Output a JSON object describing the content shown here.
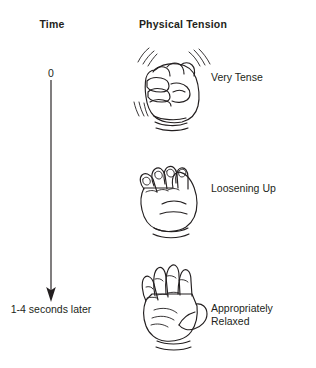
{
  "figure": {
    "background_color": "#ffffff",
    "ink_color": "#231f20"
  },
  "columns": [
    {
      "id": "time",
      "header": "Time"
    },
    {
      "id": "physical_tension",
      "header": "Physical Tension"
    }
  ],
  "time_axis": {
    "start_label": "0",
    "end_label": "1-4 seconds\nlater",
    "direction": "downward",
    "arrow_icon": "down-arrow-icon"
  },
  "rows": [
    {
      "time_marker": "0",
      "hand_icon": "clenched-fist-icon",
      "hand_description": "Tightly clenched fist with vibration motion lines",
      "state_label": "Very Tense"
    },
    {
      "time_marker": "",
      "hand_icon": "loose-fist-icon",
      "hand_description": "Partially opened hand, fingers uncurling",
      "state_label": "Loosening Up"
    },
    {
      "time_marker": "1-4 seconds later",
      "hand_icon": "open-palm-icon",
      "hand_description": "Fully open relaxed palm",
      "state_label": "Appropriately\nRelaxed"
    }
  ]
}
